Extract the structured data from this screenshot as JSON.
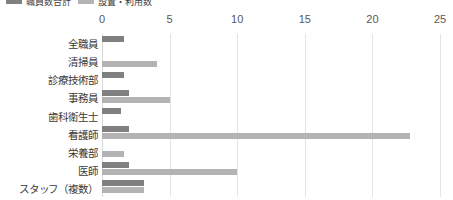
{
  "colors": {
    "series_0": "#808080",
    "series_1": "#b3b3b3",
    "gridline": "#e4e4e4",
    "zero_line": "#d9d9d9",
    "text": "#3a3a3a",
    "tick_text": "#595959",
    "background": "#ffffff"
  },
  "legend": {
    "entries": [
      {
        "label": "職員数合計",
        "color": "#808080"
      },
      {
        "label": "設置・利用数",
        "color": "#b3b3b3"
      }
    ],
    "clipped": true
  },
  "chart_data": {
    "type": "bar",
    "orientation": "horizontal",
    "title": "",
    "subtitle": "",
    "xlabel": "",
    "ylabel": "",
    "xlim": [
      0,
      25
    ],
    "xticks": [
      0,
      5,
      10,
      15,
      20,
      25
    ],
    "xtick_labels": [
      "0",
      "5",
      "10",
      "15",
      "20",
      "25"
    ],
    "grid": true,
    "grid_axis": "x",
    "legend_position": "top-left",
    "categories": [
      "全職員",
      "清掃員",
      "診療技術部",
      "事務員",
      "歯科衛生士",
      "看護師",
      "栄養部",
      "医師",
      "スタッフ（複数）"
    ],
    "series": [
      {
        "name": "職員数合計",
        "color": "#808080",
        "values": [
          1.6,
          0,
          1.6,
          2.0,
          1.4,
          2.0,
          0,
          2.0,
          3.1
        ]
      },
      {
        "name": "設置・利用数",
        "color": "#b3b3b3",
        "values": [
          0,
          4.1,
          0,
          5.0,
          0,
          22.8,
          1.6,
          10.0,
          3.1
        ]
      }
    ]
  }
}
